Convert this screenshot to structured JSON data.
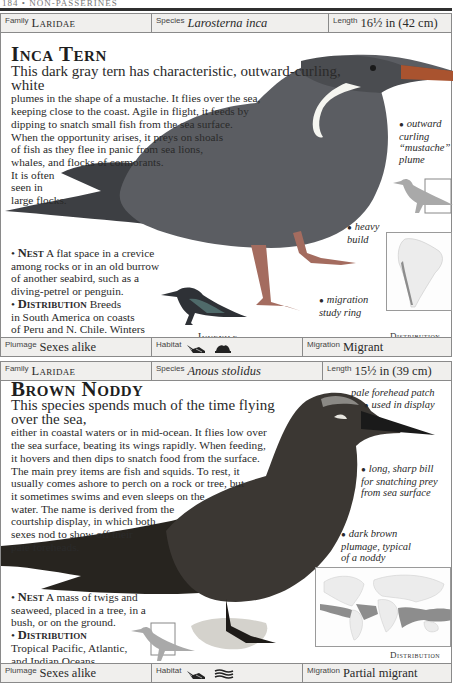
{
  "page_header": {
    "text": "184 • NON-PASSERINES"
  },
  "species": [
    {
      "info": {
        "family_label": "Family",
        "family": "Laridae",
        "species_label": "Species",
        "species": "Larosterna inca",
        "length_label": "Length",
        "length": "16½ in (42 cm)"
      },
      "title": "Inca Tern",
      "description": [
        "This dark gray tern has characteristic, outward-curling, white",
        "plumes in the shape of a mustache. It flies over the sea,",
        "keeping close to the coast. Agile in flight, it feeds by",
        "dipping to snatch small fish from the sea surface.",
        "When the opportunity arises, it preys on shoals",
        "of fish as they flee in panic from sea lions,",
        "whales, and flocks of cormorants.",
        "It is often",
        "seen in",
        "large flocks."
      ],
      "callouts": [
        {
          "id": "mustache",
          "lines": [
            "outward",
            "curling",
            "“mustache”",
            "plume"
          ]
        },
        {
          "id": "build",
          "lines": [
            "heavy",
            "build"
          ]
        },
        {
          "id": "ring",
          "lines": [
            "migration",
            "study ring"
          ]
        }
      ],
      "nest": {
        "heading": "Nest",
        "lines": [
          "A flat space in a crevice",
          "among rocks or in an old burrow",
          "of another seabird, such as a",
          "diving-petrel or penguin."
        ]
      },
      "distribution": {
        "heading": "Distribution",
        "lines": [
          "Breeds",
          "in South America on coasts",
          "of Peru and N. Chile. Winters",
          "from Ecuador south to C. Chile."
        ]
      },
      "juvenile_caption": "Juvenile",
      "map_caption": "Distribution",
      "footer": {
        "plumage_label": "Plumage",
        "plumage": "Sexes alike",
        "habitat_label": "Habitat",
        "habitat_icons": [
          "sea-waves-icon",
          "coast-rocks-icon"
        ],
        "migration_label": "Migration",
        "migration": "Migrant"
      }
    },
    {
      "info": {
        "family_label": "Family",
        "family": "Laridae",
        "species_label": "Species",
        "species": "Anous stolidus",
        "length_label": "Length",
        "length": "15½ in (39 cm)"
      },
      "title": "Brown Noddy",
      "description": [
        "This species spends much of the time flying over the sea,",
        "either in coastal waters or in mid-ocean. It flies low over",
        "the sea surface, beating its wings rapidly. When feeding,",
        "it hovers and then dips to snatch food from the surface.",
        "The main prey items are fish and squids. To rest, it",
        "usually comes ashore to perch on a rock or tree, but",
        "it sometimes swims and even sleeps on the",
        "water. The name is derived from the",
        "courtship display, in which both",
        "sexes nod to show off their",
        "pale foreheads."
      ],
      "callouts": [
        {
          "id": "forehead",
          "lines": [
            "pale forehead patch",
            "used in display"
          ]
        },
        {
          "id": "bill",
          "lines": [
            "long, sharp bill",
            "for snatching prey",
            "from sea surface"
          ]
        },
        {
          "id": "plumage",
          "lines": [
            "dark brown",
            "plumage, typical",
            "of a noddy"
          ]
        }
      ],
      "nest": {
        "heading": "Nest",
        "lines": [
          "A mass of twigs and",
          "seaweed, placed in a tree, in a",
          "bush, or on the ground."
        ]
      },
      "distribution": {
        "heading": "Distribution",
        "lines": [
          "Tropical Pacific, Atlantic,",
          "and Indian Oceans."
        ]
      },
      "map_caption": "Distribution",
      "footer": {
        "plumage_label": "Plumage",
        "plumage": "Sexes alike",
        "habitat_label": "Habitat",
        "habitat_icons": [
          "sea-waves-icon",
          "open-ocean-icon"
        ],
        "migration_label": "Migration",
        "migration": "Partial migrant"
      }
    }
  ],
  "colors": {
    "infobar_bg": "#f0efed",
    "border": "#8a8a8a",
    "inca_tern_body": "#5b5d62",
    "noddy_body": "#3b3733",
    "map_land": "#ececec",
    "map_range": "#8d8d8d"
  }
}
